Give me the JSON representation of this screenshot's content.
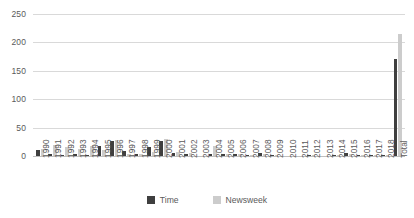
{
  "chart_data": {
    "type": "bar",
    "title": "",
    "subtitle": "",
    "xlabel": "",
    "ylabel": "",
    "ylim": [
      0,
      250
    ],
    "yticks": [
      0,
      50,
      100,
      150,
      200,
      250
    ],
    "grid": true,
    "legend_position": "bottom",
    "orientation": "vertical",
    "categories": [
      "1990",
      "1991",
      "1992",
      "1993",
      "1994",
      "1995",
      "1996",
      "1997",
      "1998",
      "1999",
      "2000",
      "2001",
      "2002",
      "2003",
      "2004",
      "2005",
      "2006",
      "2007",
      "2008",
      "2009",
      "2010",
      "2011",
      "2012",
      "2013",
      "2014",
      "2015",
      "2016",
      "2017",
      "2018",
      "Total"
    ],
    "series": [
      {
        "name": "Time",
        "color": "#3f3f3f",
        "values": [
          10,
          3,
          2,
          3,
          1,
          18,
          27,
          8,
          4,
          15,
          27,
          5,
          3,
          0,
          4,
          4,
          3,
          2,
          5,
          1,
          0,
          0,
          2,
          0,
          1,
          6,
          2,
          1,
          1,
          170
        ]
      },
      {
        "name": "Newsweek",
        "color": "#cccccc",
        "values": [
          13,
          19,
          15,
          12,
          18,
          11,
          28,
          4,
          4,
          7,
          30,
          7,
          5,
          0,
          17,
          3,
          4,
          1,
          3,
          1,
          0,
          0,
          1,
          0,
          1,
          4,
          1,
          1,
          1,
          215
        ]
      }
    ]
  },
  "legend": {
    "items": [
      {
        "label": "Time",
        "key": "time"
      },
      {
        "label": "Newsweek",
        "key": "newsweek"
      }
    ]
  }
}
